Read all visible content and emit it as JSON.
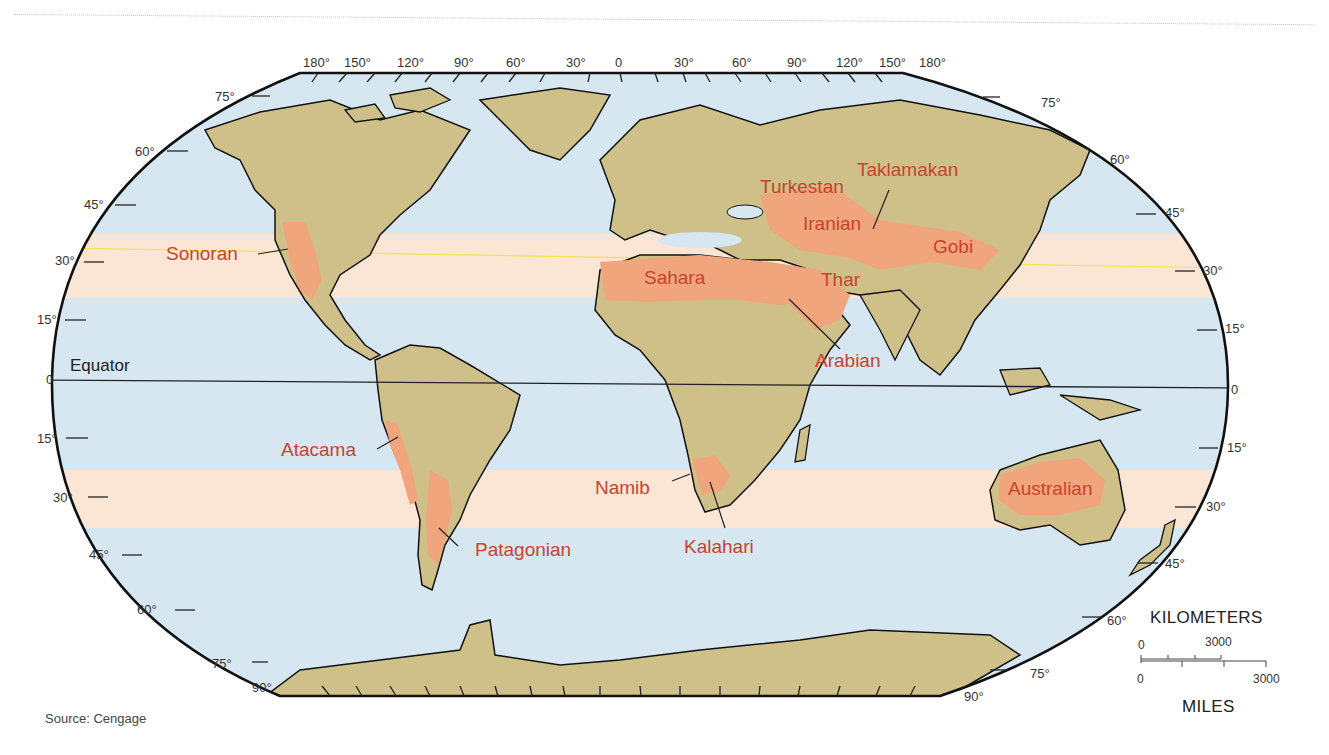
{
  "map": {
    "title": "World Deserts",
    "projection": "Robinson",
    "colors": {
      "ocean": "#d6e7f2",
      "land": "#cfc08a",
      "desert": "#f0a57c",
      "dry_belt": "#fbe6d6",
      "desert_label": "#c8432d",
      "outline": "#111111",
      "tropic_line": "#f2e44a"
    },
    "top_longitudes": [
      "180°",
      "150°",
      "120°",
      "90°",
      "60°",
      "30°",
      "0",
      "30°",
      "60°",
      "90°",
      "120°",
      "150°",
      "180°"
    ],
    "left_latitudes": [
      "75°",
      "60°",
      "45°",
      "30°",
      "15°",
      "0",
      "15°",
      "30°",
      "45°",
      "60°",
      "75°",
      "90°"
    ],
    "right_latitudes": [
      "75°",
      "60°",
      "45°",
      "30°",
      "15°",
      "0",
      "15°",
      "30°",
      "45°",
      "60°",
      "75°",
      "90°"
    ],
    "equator_label": "Equator",
    "deserts": [
      {
        "name": "Sonoran"
      },
      {
        "name": "Atacama"
      },
      {
        "name": "Patagonian"
      },
      {
        "name": "Sahara"
      },
      {
        "name": "Namib"
      },
      {
        "name": "Kalahari"
      },
      {
        "name": "Arabian"
      },
      {
        "name": "Thar"
      },
      {
        "name": "Iranian"
      },
      {
        "name": "Turkestan"
      },
      {
        "name": "Taklamakan"
      },
      {
        "name": "Gobi"
      },
      {
        "name": "Australian"
      }
    ]
  },
  "scale": {
    "km_title": "KILOMETERS",
    "km_start": "0",
    "km_end": "3000",
    "mi_start": "0",
    "mi_end": "3000",
    "mi_title": "MILES"
  },
  "source": "Source: Cengage"
}
